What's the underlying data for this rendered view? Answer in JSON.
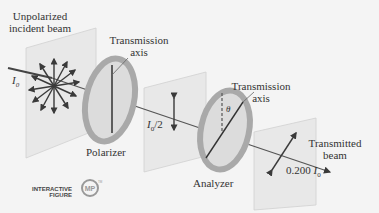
{
  "figure": {
    "labels": {
      "incident_beam": [
        "Unpolarized",
        "incident beam"
      ],
      "intensity_in": "I",
      "intensity_in_sub": "0",
      "transmission_axis_1": [
        "Transmission",
        "axis"
      ],
      "polarizer": "Polarizer",
      "intensity_mid": "I",
      "intensity_mid_sub": "0",
      "intensity_mid_suffix": "/2",
      "transmission_axis_2": [
        "Transmission",
        "axis"
      ],
      "angle": "θ",
      "analyzer": "Analyzer",
      "transmitted_beam": [
        "Transmitted",
        "beam"
      ],
      "intensity_out_prefix": "0.200 ",
      "intensity_out": "I",
      "intensity_out_sub": "0"
    },
    "badge": {
      "line1": "INTERACTIVE",
      "line2": "FIGURE",
      "logo": "MP",
      "tm": "TM"
    },
    "colors": {
      "background": "#f4f4f4",
      "plane_fill": "#e6e6e6",
      "plane_stroke": "#cfcfcf",
      "ring": "#a9a9a9",
      "ring_inner": "#dcdcdc",
      "beam": "#555555",
      "arrow": "#3a3a3a",
      "logo": "#999999"
    }
  }
}
